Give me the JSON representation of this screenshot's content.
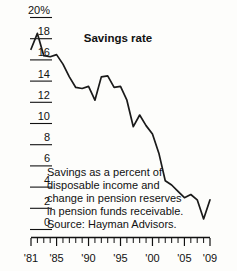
{
  "chart_data": {
    "type": "line",
    "title": "Savings rate",
    "xlabel": "",
    "ylabel": "",
    "ylim": [
      0,
      20
    ],
    "xlim": [
      1981,
      2009
    ],
    "grid": false,
    "legend_position": "none",
    "y_ticks": [
      0,
      2,
      4,
      6,
      8,
      10,
      12,
      14,
      16,
      18,
      20
    ],
    "y_tick_labels": [
      "0",
      "2",
      "4",
      "6",
      "8",
      "10",
      "12",
      "14",
      "16",
      "18",
      "20%"
    ],
    "x_ticks": [
      1981,
      1985,
      1990,
      1995,
      2000,
      2005,
      2009
    ],
    "x_tick_labels": [
      "'81",
      "'85",
      "'90",
      "'95",
      "'00",
      "'05",
      "'09"
    ],
    "x_minor_tick_interval": 1,
    "series": [
      {
        "name": "Savings rate",
        "color": "#1a1a1a",
        "x": [
          1981,
          1982,
          1983,
          1984,
          1985,
          1986,
          1987,
          1988,
          1989,
          1990,
          1991,
          1992,
          1993,
          1994,
          1995,
          1996,
          1997,
          1998,
          1999,
          2000,
          2001,
          2002,
          2003,
          2004,
          2005,
          2006,
          2007,
          2008,
          2009
        ],
        "values": [
          17.0,
          18.5,
          16.4,
          16.3,
          16.5,
          15.6,
          14.4,
          13.4,
          13.3,
          13.5,
          12.2,
          14.4,
          14.5,
          13.4,
          13.5,
          12.2,
          9.7,
          10.8,
          9.8,
          9.0,
          7.2,
          4.6,
          4.2,
          3.6,
          3.0,
          3.3,
          2.8,
          1.0,
          2.8
        ]
      }
    ],
    "annotations": [
      "Savings as a percent of",
      "disposable income and",
      "change in pension reserves",
      "in pension funds receivable.",
      "Source: Hayman Advisors."
    ]
  },
  "caption": {
    "line1": "Savings as a percent of",
    "line2": "disposable income and",
    "line3": "change in pension reserves",
    "line4": "in pension funds receivable.",
    "line5": "Source: Hayman Advisors."
  }
}
